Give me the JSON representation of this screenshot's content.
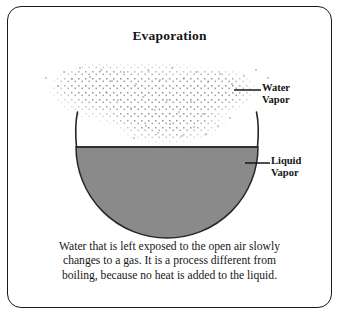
{
  "figure": {
    "title": "Evaporation",
    "border_color": "#1a1a1a",
    "background": "#ffffff"
  },
  "diagram": {
    "liquid_fill_color": "#8a8a8a",
    "outline_color": "#262626",
    "vapor_dot_color": "#8e8e8e",
    "bowl": {
      "center_x": 167,
      "center_y": 147,
      "radius": 91,
      "rim_top_y": 113,
      "water_line_y": 147,
      "bottom_y": 238
    }
  },
  "labels": {
    "water_vapor": {
      "line1": "Water",
      "line2": "Vapor"
    },
    "liquid_vapor": {
      "line1": "Liquid",
      "line2": "Vapor"
    }
  },
  "caption": {
    "line1": "Water that is left exposed to the open air slowly",
    "line2": "changes to a gas. It is a process different from",
    "line3": "boiling, because no heat is added to the liquid."
  }
}
